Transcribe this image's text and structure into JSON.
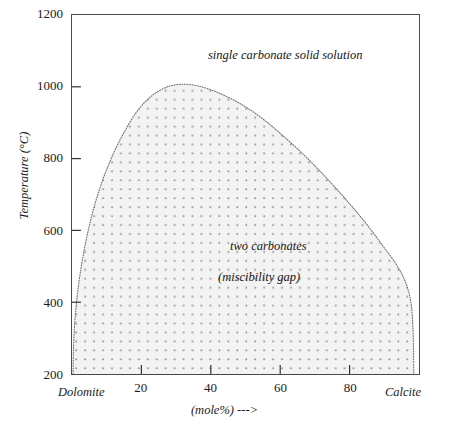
{
  "chart_data": {
    "type": "area",
    "title": "",
    "xlabel": "(mole%)  --->",
    "ylabel": "Temperature (°C)",
    "xlim": [
      0,
      100
    ],
    "ylim": [
      200,
      1200
    ],
    "grid": false,
    "legend": "none",
    "x_ticks": [
      {
        "value": 20,
        "label": "20"
      },
      {
        "value": 40,
        "label": "40"
      },
      {
        "value": 60,
        "label": "60"
      },
      {
        "value": 80,
        "label": "80"
      }
    ],
    "y_ticks": [
      {
        "value": 200,
        "label": "200"
      },
      {
        "value": 400,
        "label": "400"
      },
      {
        "value": 600,
        "label": "600"
      },
      {
        "value": 800,
        "label": "800"
      },
      {
        "value": 1000,
        "label": "1000"
      },
      {
        "value": 1200,
        "label": "1200"
      }
    ],
    "endmembers": {
      "left": "Dolomite",
      "right": "Calcite"
    },
    "annotations": [
      {
        "id": "single-carbonate",
        "text": "single carbonate solid solution",
        "x": 37,
        "y": 1140
      },
      {
        "id": "two-carbonates",
        "text": "two  carbonates",
        "x": 44,
        "y": 600
      },
      {
        "id": "miscibility-gap",
        "text": "(miscibility gap)",
        "x": 41,
        "y": 520
      }
    ],
    "series": [
      {
        "name": "solvus",
        "fill_color": "#f2f2f2",
        "stipple_color": "#8c8c8c",
        "line_style": "dotted",
        "points": [
          {
            "x": 0.3,
            "y": 200
          },
          {
            "x": 0.4,
            "y": 260
          },
          {
            "x": 0.7,
            "y": 330
          },
          {
            "x": 1.3,
            "y": 400
          },
          {
            "x": 2.2,
            "y": 470
          },
          {
            "x": 3.4,
            "y": 540
          },
          {
            "x": 4.9,
            "y": 610
          },
          {
            "x": 6.8,
            "y": 680
          },
          {
            "x": 9.2,
            "y": 750
          },
          {
            "x": 12.2,
            "y": 820
          },
          {
            "x": 15.4,
            "y": 880
          },
          {
            "x": 19.0,
            "y": 935
          },
          {
            "x": 23.0,
            "y": 975
          },
          {
            "x": 27.5,
            "y": 1000
          },
          {
            "x": 32.0,
            "y": 1007
          },
          {
            "x": 36.5,
            "y": 1002
          },
          {
            "x": 41.0,
            "y": 988
          },
          {
            "x": 46.0,
            "y": 966
          },
          {
            "x": 51.0,
            "y": 938
          },
          {
            "x": 56.0,
            "y": 903
          },
          {
            "x": 61.0,
            "y": 862
          },
          {
            "x": 66.0,
            "y": 818
          },
          {
            "x": 71.0,
            "y": 770
          },
          {
            "x": 76.0,
            "y": 718
          },
          {
            "x": 81.0,
            "y": 663
          },
          {
            "x": 85.5,
            "y": 610
          },
          {
            "x": 89.5,
            "y": 558
          },
          {
            "x": 93.0,
            "y": 512
          },
          {
            "x": 95.5,
            "y": 470
          },
          {
            "x": 97.0,
            "y": 430
          },
          {
            "x": 97.8,
            "y": 390
          },
          {
            "x": 98.2,
            "y": 340
          },
          {
            "x": 98.4,
            "y": 280
          },
          {
            "x": 98.5,
            "y": 200
          }
        ]
      }
    ],
    "regions": [
      {
        "name": "single carbonate solid solution",
        "location": "above-solvus"
      },
      {
        "name": "two carbonates (miscibility gap)",
        "location": "below-solvus"
      }
    ]
  },
  "colors": {
    "frame": "#4a4a4a",
    "fill": "#f2f2f2",
    "stipple": "#8c8c8c",
    "text": "#1a1a1a"
  }
}
